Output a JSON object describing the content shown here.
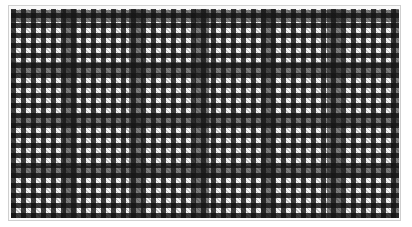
{
  "image": {
    "subject": "plaid-textile",
    "pattern": "glen-check",
    "colors": {
      "dark": "#111111",
      "light": "#f2f2f2",
      "border": "#cfcfcf",
      "background": "#ffffff"
    }
  }
}
